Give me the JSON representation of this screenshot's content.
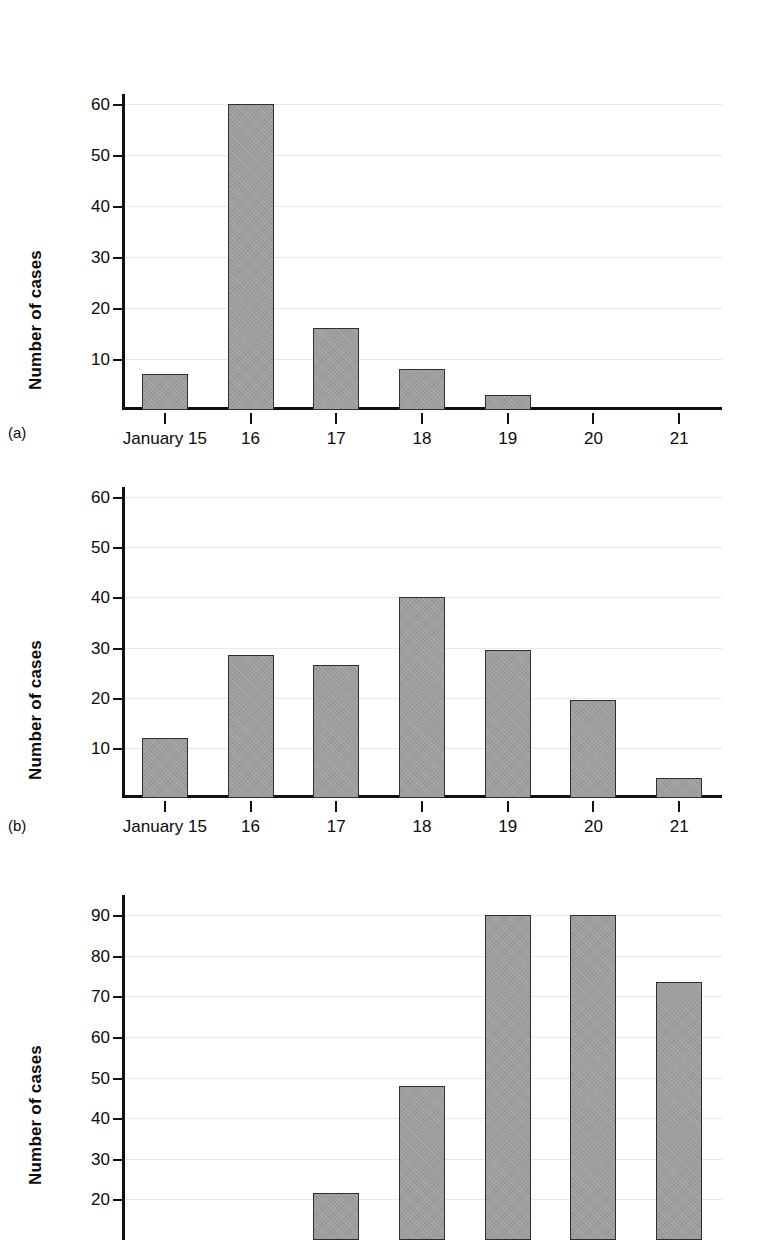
{
  "figure": {
    "panels": [
      {
        "letter": "(a)"
      },
      {
        "letter": "(b)"
      },
      {
        "letter": "(c)"
      }
    ],
    "bar_fill": "#9d9d9d",
    "bar_stroke": "#2f2f2f",
    "grid_color": "#e9e9e9",
    "axis_color": "#111111"
  },
  "chart_data": [
    {
      "id": "a",
      "type": "bar",
      "title": "",
      "xlabel": "",
      "ylabel": "Number of cases",
      "categories": [
        "January 15",
        "16",
        "17",
        "18",
        "19",
        "20",
        "21"
      ],
      "values": [
        7,
        60,
        16,
        8,
        3,
        0,
        0
      ],
      "yticks": [
        10,
        20,
        30,
        40,
        50,
        60
      ],
      "ytick_labels": [
        "10",
        "20",
        "30",
        "40",
        "50",
        "60"
      ],
      "ylim": [
        0,
        62
      ],
      "grid": "horizontal",
      "legend": "none",
      "panel_letter": "(a)"
    },
    {
      "id": "b",
      "type": "bar",
      "title": "",
      "xlabel": "",
      "ylabel": "Number of cases",
      "categories": [
        "January 15",
        "16",
        "17",
        "18",
        "19",
        "20",
        "21"
      ],
      "values": [
        12,
        28.5,
        26.5,
        40,
        29.5,
        19.5,
        4
      ],
      "yticks": [
        10,
        20,
        30,
        40,
        50,
        60
      ],
      "ytick_labels": [
        "10",
        "20",
        "30",
        "40",
        "50",
        "60"
      ],
      "ylim": [
        0,
        62
      ],
      "grid": "horizontal",
      "legend": "none",
      "panel_letter": "(b)"
    },
    {
      "id": "c",
      "type": "bar",
      "title": "",
      "xlabel": "",
      "ylabel": "Number of cases",
      "categories": [
        "",
        "",
        "",
        "",
        "",
        "",
        ""
      ],
      "values": [
        0,
        0,
        21.5,
        48,
        90,
        90,
        73.5
      ],
      "yticks": [
        20,
        30,
        40,
        50,
        60,
        70,
        80,
        90
      ],
      "ytick_labels": [
        "20",
        "30",
        "40",
        "50",
        "60",
        "70",
        "80",
        "90"
      ],
      "ylim": [
        10,
        95
      ],
      "grid": "horizontal",
      "legend": "none",
      "panel_letter": "(c)",
      "note": "panel cropped at image bottom; x axis labels not visible"
    }
  ]
}
